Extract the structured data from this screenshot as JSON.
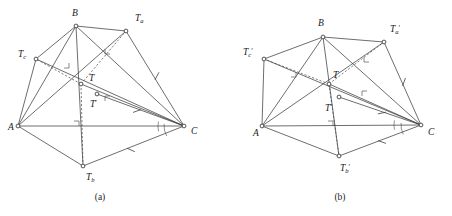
{
  "figure": {
    "title": "",
    "width": 452,
    "height": 216,
    "background": "#ffffff",
    "stroke_color": "#3d3d3d",
    "vertex_fill": "#ffffff"
  },
  "captions": [
    {
      "id": "caption-a",
      "text": "(a)",
      "x": 100,
      "y": 200
    },
    {
      "id": "caption-b",
      "text": "(b)",
      "x": 340,
      "y": 200
    }
  ],
  "panels": [
    {
      "id": "panel-a",
      "caption": "(a)",
      "points": [
        {
          "name": "A",
          "label": "A",
          "sub": "",
          "prime": false,
          "x": 18,
          "y": 126,
          "lx": 8,
          "ly": 130
        },
        {
          "name": "B",
          "label": "B",
          "sub": "",
          "prime": false,
          "x": 76,
          "y": 26,
          "lx": 72,
          "ly": 16
        },
        {
          "name": "C",
          "label": "C",
          "sub": "",
          "prime": false,
          "x": 184,
          "y": 126,
          "lx": 191,
          "ly": 134
        },
        {
          "name": "Ta",
          "label": "T",
          "sub": "a",
          "prime": false,
          "x": 126,
          "y": 31,
          "lx": 135,
          "ly": 21
        },
        {
          "name": "Tb",
          "label": "T",
          "sub": "b",
          "prime": false,
          "x": 83,
          "y": 166,
          "lx": 86,
          "ly": 180
        },
        {
          "name": "Tc",
          "label": "T",
          "sub": "c",
          "prime": false,
          "x": 36,
          "y": 59,
          "lx": 18,
          "ly": 57
        },
        {
          "name": "T",
          "label": "T",
          "sub": "",
          "prime": false,
          "x": 81,
          "y": 84,
          "lx": 89,
          "ly": 81
        },
        {
          "name": "Tp",
          "label": "T",
          "sub": "",
          "prime": true,
          "x": 97,
          "y": 94,
          "lx": 90,
          "ly": 107
        }
      ],
      "solid_edges": [
        [
          "A",
          "C"
        ],
        [
          "A",
          "B"
        ],
        [
          "B",
          "C"
        ],
        [
          "A",
          "Ta"
        ],
        [
          "B",
          "Ta"
        ],
        [
          "Ta",
          "C"
        ],
        [
          "A",
          "Tb"
        ],
        [
          "Tb",
          "C"
        ],
        [
          "B",
          "Tb"
        ],
        [
          "A",
          "Tc"
        ],
        [
          "B",
          "Tc"
        ],
        [
          "Tc",
          "C"
        ],
        [
          "Tp",
          "C"
        ],
        [
          "T",
          "C"
        ]
      ],
      "dashed_edges": [
        [
          "T",
          "Tb"
        ],
        [
          "T",
          "Ta"
        ],
        [
          "T",
          "Tc"
        ]
      ],
      "right_angles": [
        {
          "at_x": 74,
          "at_y": 126,
          "dir": "up-right"
        },
        {
          "at_x": 64,
          "at_y": 63,
          "dir": "down-right"
        },
        {
          "at_x": 110,
          "at_y": 49,
          "dir": "down-left"
        },
        {
          "at_x": 110,
          "at_y": 101,
          "dir": "up-left"
        }
      ],
      "tick_marks": [
        {
          "x": 157,
          "y": 76,
          "angle": -62
        },
        {
          "x": 131,
          "y": 150,
          "angle": 24
        },
        {
          "x": 137,
          "y": 111,
          "angle": -20
        }
      ],
      "angle_arcs": [
        {
          "cx": 184,
          "cy": 126,
          "r": 20,
          "a0": 150,
          "a1": 186
        },
        {
          "cx": 184,
          "cy": 126,
          "r": 26,
          "a0": 168,
          "a1": 190
        }
      ]
    },
    {
      "id": "panel-b",
      "caption": "(b)",
      "points": [
        {
          "name": "A",
          "label": "A",
          "sub": "",
          "prime": false,
          "x": 262,
          "y": 126,
          "lx": 253,
          "ly": 136
        },
        {
          "name": "B",
          "label": "B",
          "sub": "",
          "prime": false,
          "x": 323,
          "y": 37,
          "lx": 318,
          "ly": 26
        },
        {
          "name": "C",
          "label": "C",
          "sub": "",
          "prime": false,
          "x": 421,
          "y": 125,
          "lx": 428,
          "ly": 135
        },
        {
          "name": "Ta",
          "label": "T",
          "sub": "a",
          "prime": true,
          "x": 384,
          "y": 42,
          "lx": 390,
          "ly": 32
        },
        {
          "name": "Tb",
          "label": "T",
          "sub": "b",
          "prime": true,
          "x": 339,
          "y": 156,
          "lx": 340,
          "ly": 171
        },
        {
          "name": "Tc",
          "label": "T",
          "sub": "c",
          "prime": true,
          "x": 264,
          "y": 59,
          "lx": 243,
          "ly": 55
        },
        {
          "name": "T",
          "label": "T",
          "sub": "",
          "prime": false,
          "x": 329,
          "y": 84,
          "lx": 333,
          "ly": 78
        },
        {
          "name": "Tp",
          "label": "T",
          "sub": "",
          "prime": true,
          "x": 339,
          "y": 97,
          "lx": 325,
          "ly": 111
        }
      ],
      "solid_edges": [
        [
          "A",
          "C"
        ],
        [
          "A",
          "B"
        ],
        [
          "B",
          "C"
        ],
        [
          "A",
          "Ta"
        ],
        [
          "B",
          "Ta"
        ],
        [
          "Ta",
          "C"
        ],
        [
          "A",
          "Tb"
        ],
        [
          "Tb",
          "C"
        ],
        [
          "B",
          "Tb"
        ],
        [
          "A",
          "Tc"
        ],
        [
          "B",
          "Tc"
        ],
        [
          "Tc",
          "C"
        ],
        [
          "Tp",
          "C"
        ],
        [
          "T",
          "C"
        ]
      ],
      "dashed_edges": [
        [
          "T",
          "Tb"
        ],
        [
          "T",
          "Ta"
        ],
        [
          "T",
          "Tc"
        ]
      ],
      "right_angles": [
        {
          "at_x": 328,
          "at_y": 126,
          "dir": "up-right"
        },
        {
          "at_x": 291,
          "at_y": 72,
          "dir": "down-right"
        },
        {
          "at_x": 369,
          "at_y": 57,
          "dir": "down-left"
        },
        {
          "at_x": 367,
          "at_y": 96,
          "dir": "up-left"
        }
      ],
      "tick_marks": [
        {
          "x": 404,
          "y": 82,
          "angle": -70
        },
        {
          "x": 382,
          "y": 142,
          "angle": 20
        },
        {
          "x": 382,
          "y": 113,
          "angle": -12
        }
      ],
      "angle_arcs": [
        {
          "cx": 421,
          "cy": 125,
          "r": 20,
          "a0": 152,
          "a1": 186
        },
        {
          "cx": 421,
          "cy": 125,
          "r": 27,
          "a0": 170,
          "a1": 190
        }
      ]
    }
  ]
}
